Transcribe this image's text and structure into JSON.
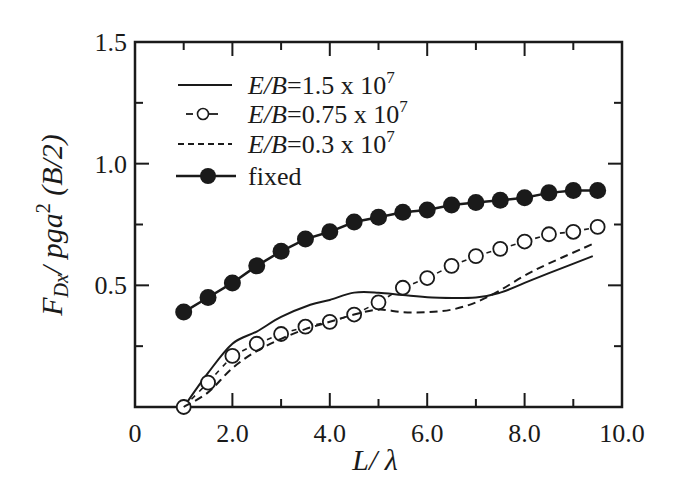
{
  "chart_data": {
    "type": "line",
    "title": "",
    "xlabel": "L/ λ",
    "ylabel": "F_Dx / pga^2 (B/2)",
    "ylabel_parts": {
      "main": "F",
      "sub": "Dx",
      "mid": "/ pga",
      "sup": "2",
      "tail": " (B/2)"
    },
    "xlim": [
      0,
      10
    ],
    "ylim": [
      0,
      1.5
    ],
    "x_ticks": [
      {
        "value": 0,
        "label": "0"
      },
      {
        "value": 2,
        "label": "2.0"
      },
      {
        "value": 4,
        "label": "4.0"
      },
      {
        "value": 6,
        "label": "6.0"
      },
      {
        "value": 8,
        "label": "8.0"
      },
      {
        "value": 10,
        "label": "10.0"
      }
    ],
    "x_minor_ticks": [
      1,
      3,
      5,
      7,
      9
    ],
    "y_ticks": [
      {
        "value": 0.5,
        "label": "0.5"
      },
      {
        "value": 1.0,
        "label": "1.0"
      },
      {
        "value": 1.5,
        "label": "1.5"
      }
    ],
    "y_minor_ticks": [
      0.25,
      0.75,
      1.25
    ],
    "grid": false,
    "legend_position": "upper left",
    "series": [
      {
        "name": "E/B=1.5 x 10^7",
        "legend_italic": "E/B",
        "legend_rest": "=1.5 x 10",
        "legend_sup": "7",
        "style": "solid",
        "marker": "none",
        "x": [
          1.0,
          1.5,
          2.0,
          2.5,
          3.0,
          3.6,
          4.0,
          4.5,
          5.0,
          5.5,
          6.1,
          7.0,
          7.5,
          8.0,
          8.5,
          9.4
        ],
        "values": [
          0.0,
          0.14,
          0.26,
          0.31,
          0.37,
          0.42,
          0.44,
          0.47,
          0.47,
          0.46,
          0.45,
          0.45,
          0.47,
          0.51,
          0.55,
          0.62
        ]
      },
      {
        "name": "E/B=0.75 x 10^7",
        "legend_italic": "E/B",
        "legend_rest": "=0.75 x 10",
        "legend_sup": "7",
        "style": "dash-open-circle",
        "marker": "open-circle",
        "x": [
          1.0,
          1.5,
          2.0,
          2.5,
          3.0,
          3.5,
          4.0,
          4.5,
          5.0,
          5.5,
          6.0,
          6.5,
          7.0,
          7.5,
          8.0,
          8.5,
          9.0,
          9.5
        ],
        "values": [
          0.0,
          0.1,
          0.21,
          0.26,
          0.3,
          0.33,
          0.35,
          0.38,
          0.43,
          0.49,
          0.53,
          0.58,
          0.62,
          0.65,
          0.68,
          0.71,
          0.72,
          0.74
        ]
      },
      {
        "name": "E/B=0.3 x 10^7",
        "legend_italic": "E/B",
        "legend_rest": "=0.3 x 10",
        "legend_sup": "7",
        "style": "dashed",
        "marker": "none",
        "x": [
          1.0,
          1.5,
          2.0,
          2.5,
          3.0,
          3.5,
          4.0,
          4.5,
          5.0,
          5.5,
          6.0,
          6.5,
          7.0,
          7.5,
          8.0,
          8.5,
          9.4
        ],
        "values": [
          0.0,
          0.06,
          0.16,
          0.23,
          0.28,
          0.32,
          0.35,
          0.38,
          0.4,
          0.39,
          0.39,
          0.4,
          0.43,
          0.48,
          0.54,
          0.59,
          0.67
        ]
      },
      {
        "name": "fixed",
        "legend_italic": "",
        "legend_rest": "fixed",
        "legend_sup": "",
        "style": "solid",
        "marker": "filled-circle",
        "x": [
          1.0,
          1.5,
          2.0,
          2.5,
          3.0,
          3.5,
          4.0,
          4.5,
          5.0,
          5.5,
          6.0,
          6.5,
          7.0,
          7.5,
          8.0,
          8.5,
          9.0,
          9.5
        ],
        "values": [
          0.39,
          0.45,
          0.51,
          0.58,
          0.64,
          0.69,
          0.72,
          0.76,
          0.78,
          0.8,
          0.81,
          0.83,
          0.84,
          0.85,
          0.86,
          0.88,
          0.89,
          0.89
        ]
      }
    ]
  },
  "colors": {
    "ink": "#1a1a1a",
    "background": "#ffffff"
  }
}
